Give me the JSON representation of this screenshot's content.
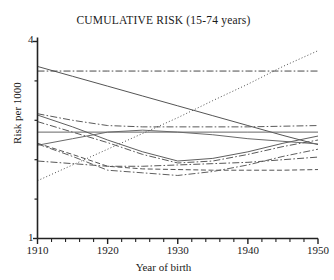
{
  "chart_data": {
    "type": "line",
    "title": "CUMULATIVE RISK (15-74 years)",
    "xlabel": "Year of birth",
    "ylabel": "Risk per 1000",
    "xlim": [
      1910,
      1950
    ],
    "ylim": [
      1,
      4
    ],
    "grid": false,
    "legend": "none",
    "xticks_major": [
      1910,
      1920,
      1930,
      1940,
      1950
    ],
    "xticks_major_labels": [
      "1910",
      "1920",
      "1930",
      "1940",
      "1950"
    ],
    "xticks_minor_step": 2,
    "yticks_major": [
      1,
      4
    ],
    "yticks_major_labels": [
      "1",
      "4"
    ],
    "yticks_minor": [
      1.6,
      2.2,
      2.8,
      3.4
    ],
    "x": [
      1910,
      1915,
      1920,
      1925,
      1930,
      1935,
      1940,
      1945,
      1950
    ],
    "series": [
      {
        "name": "series-1",
        "style": "solid",
        "color": "#555555",
        "values": [
          3.62,
          3.47,
          3.32,
          3.17,
          3.02,
          2.87,
          2.72,
          2.57,
          2.43
        ]
      },
      {
        "name": "series-2",
        "style": "dash-dot",
        "color": "#4a4a4a",
        "values": [
          3.55,
          3.55,
          3.55,
          3.55,
          3.55,
          3.55,
          3.55,
          3.55,
          3.55
        ]
      },
      {
        "name": "series-3",
        "style": "solid",
        "color": "#666666",
        "values": [
          2.62,
          2.62,
          2.62,
          2.62,
          2.62,
          2.62,
          2.62,
          2.62,
          2.62
        ]
      },
      {
        "name": "series-4",
        "style": "dash-dot",
        "color": "#5a5a5a",
        "values": [
          2.9,
          2.8,
          2.72,
          2.7,
          2.7,
          2.7,
          2.7,
          2.71,
          2.72
        ]
      },
      {
        "name": "series-5",
        "style": "solid",
        "color": "#5f5f5f",
        "values": [
          2.88,
          2.7,
          2.5,
          2.32,
          2.18,
          2.22,
          2.32,
          2.45,
          2.56
        ]
      },
      {
        "name": "series-6",
        "style": "solid",
        "color": "#6a6a6a",
        "values": [
          2.42,
          2.52,
          2.62,
          2.65,
          2.62,
          2.58,
          2.52,
          2.48,
          2.44
        ]
      },
      {
        "name": "series-7",
        "style": "dash-dot",
        "color": "#5a5a5a",
        "values": [
          2.78,
          2.62,
          2.46,
          2.28,
          2.15,
          2.18,
          2.28,
          2.4,
          2.5
        ]
      },
      {
        "name": "series-8",
        "style": "dashed",
        "color": "#555555",
        "values": [
          2.45,
          2.28,
          2.1,
          2.06,
          2.05,
          2.04,
          2.04,
          2.04,
          2.05
        ]
      },
      {
        "name": "series-9",
        "style": "dash-dot",
        "color": "#606060",
        "values": [
          2.44,
          2.25,
          2.04,
          2.0,
          1.96,
          2.02,
          2.12,
          2.25,
          2.36
        ]
      },
      {
        "name": "series-10",
        "style": "dash-dot",
        "color": "#585858",
        "values": [
          2.18,
          2.14,
          2.1,
          2.1,
          2.12,
          2.14,
          2.16,
          2.2,
          2.24
        ]
      },
      {
        "name": "series-11",
        "style": "dotted",
        "color": "#4f4f4f",
        "values": [
          1.88,
          2.12,
          2.36,
          2.6,
          2.84,
          3.1,
          3.35,
          3.62,
          3.86
        ]
      }
    ]
  },
  "axes": {
    "y_top_label": "4",
    "y_bottom_label": "1"
  }
}
